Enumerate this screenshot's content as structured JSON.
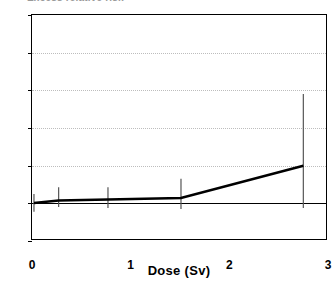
{
  "chart_data": {
    "type": "line",
    "title": "Excess relative risk",
    "xlabel": "Dose (Sv)",
    "ylabel": "",
    "xlim": [
      0,
      3
    ],
    "ylim": [
      -2,
      10
    ],
    "xticks": [
      0,
      1,
      2,
      3
    ],
    "xtick_labels": [
      "0",
      "1",
      "2",
      "3"
    ],
    "yticks": [
      -2,
      0,
      2,
      4,
      6,
      8,
      10
    ],
    "ytick_labels": [
      "-2",
      "0",
      "2",
      "4",
      "6",
      "8",
      "10"
    ],
    "grid": "horizontal-dotted",
    "legend": "none",
    "zero_reference_line": 0,
    "x": [
      0.02,
      0.27,
      0.77,
      1.51,
      2.75
    ],
    "values": [
      0.02,
      0.15,
      0.2,
      0.28,
      2.0
    ],
    "error_bars": [
      {
        "x": 0.02,
        "y": 0.02,
        "low": -0.45,
        "high": 0.5
      },
      {
        "x": 0.27,
        "y": 0.15,
        "low": -0.2,
        "high": 0.85
      },
      {
        "x": 0.77,
        "y": 0.2,
        "low": -0.25,
        "high": 0.85
      },
      {
        "x": 1.51,
        "y": 0.28,
        "low": -0.3,
        "high": 1.3
      },
      {
        "x": 2.75,
        "y": 2.0,
        "low": -0.25,
        "high": 5.8
      }
    ],
    "series": [
      {
        "name": "Excess relative risk",
        "x": [
          0.02,
          0.27,
          0.77,
          1.51,
          2.75
        ],
        "values": [
          0.02,
          0.15,
          0.2,
          0.28,
          2.0
        ]
      }
    ],
    "colors": {
      "line": "#000000",
      "error_bar": "#555555",
      "grid": "#bdbdbd",
      "axis": "#000000",
      "background": "#ffffff"
    }
  }
}
